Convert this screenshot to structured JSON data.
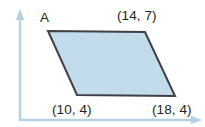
{
  "figure": {
    "kind": "coordinate-geometry-diagram",
    "background_color": "#ffffff",
    "axes": {
      "color": "#b5cfe3",
      "x_axis": {
        "name": "x-axis",
        "from": [
          20,
          120
        ],
        "to": [
          200,
          120
        ],
        "arrow": "right"
      },
      "y_axis": {
        "name": "y-axis",
        "from": [
          20,
          120
        ],
        "to": [
          20,
          10
        ],
        "arrow": "up"
      }
    },
    "shape": {
      "name": "parallelogram",
      "fill_color": "#c2dceb",
      "stroke_color": "#3f3f45",
      "stroke_width": 2,
      "vertices_px": [
        [
          48,
          31
        ],
        [
          145,
          32
        ],
        [
          175,
          96
        ],
        [
          77,
          95
        ]
      ]
    },
    "labels": {
      "vertex_label": "A",
      "top_right_coordinate": "(14, 7)",
      "bottom_left_coordinate": "(10, 4)",
      "bottom_right_coordinate": "(18, 4)"
    }
  }
}
